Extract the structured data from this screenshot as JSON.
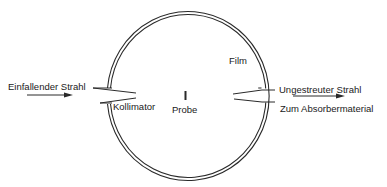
{
  "labels": {
    "incident_beam": "Einfallender Strahl",
    "collimator": "Kollimator",
    "sample": "Probe",
    "film": "Film",
    "unscattered_beam": "Ungestreuter Strahl",
    "to_absorber": "Zum Absorbermaterial"
  },
  "colors": {
    "line": "#2a2a2a",
    "background": "#ffffff"
  }
}
